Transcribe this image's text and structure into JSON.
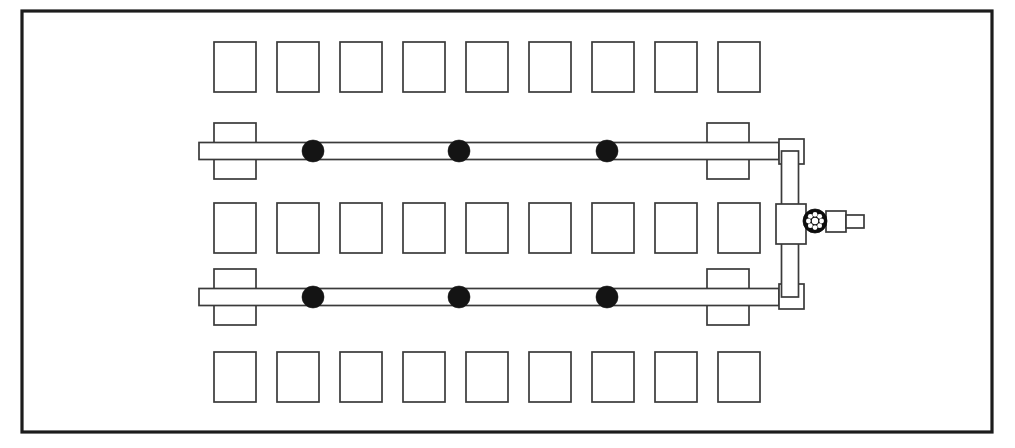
{
  "diagram": {
    "type": "technical-line-drawing",
    "width": 1015,
    "height": 448,
    "background_color": "#ffffff",
    "line_color": "#3a3a3a",
    "frame_color": "#1c1c1c",
    "fill_color": "#141414"
  },
  "frame": {
    "label": "outer-enclosure",
    "x": 22,
    "y": 11,
    "width": 970,
    "height": 421,
    "stroke_width": 3.2
  },
  "block_rows": [
    {
      "label": "upper-block-row",
      "y": 42,
      "count": 9,
      "block_width": 42,
      "block_height": 50,
      "start_x": 214,
      "pitch": 63
    },
    {
      "label": "middle-block-row",
      "y": 203,
      "count": 9,
      "block_width": 42,
      "block_height": 50,
      "start_x": 214,
      "pitch": 63
    },
    {
      "label": "lower-block-row",
      "y": 352,
      "count": 9,
      "block_width": 42,
      "block_height": 50,
      "start_x": 214,
      "pitch": 63
    }
  ],
  "pipe_rails": [
    {
      "label": "upper-spray-rail",
      "centerline_y": 151,
      "x_start": 199,
      "x_end": 779,
      "thickness": 17,
      "support_blocks": [
        {
          "x": 214,
          "width": 42,
          "height": 56
        },
        {
          "x": 707,
          "width": 42,
          "height": 56
        }
      ],
      "nozzles": [
        {
          "x": 313,
          "radius": 11
        },
        {
          "x": 459,
          "radius": 11
        },
        {
          "x": 607,
          "radius": 11
        }
      ]
    },
    {
      "label": "lower-spray-rail",
      "centerline_y": 297,
      "x_start": 199,
      "x_end": 779,
      "thickness": 17,
      "support_blocks": [
        {
          "x": 214,
          "width": 42,
          "height": 56
        },
        {
          "x": 707,
          "width": 42,
          "height": 56
        }
      ],
      "nozzles": [
        {
          "x": 313,
          "radius": 11
        },
        {
          "x": 459,
          "radius": 11
        },
        {
          "x": 607,
          "radius": 11
        }
      ]
    }
  ],
  "riser": {
    "label": "vertical-riser-pipe",
    "centerline_x": 790,
    "y_top": 151,
    "y_bottom": 297,
    "thickness": 17,
    "elbows": [
      {
        "label": "top-elbow",
        "x": 779,
        "y": 139,
        "size": 25
      },
      {
        "label": "bottom-elbow",
        "x": 779,
        "y": 284,
        "size": 25
      }
    ]
  },
  "valve": {
    "label": "handwheel-gate-valve",
    "tee": {
      "x": 776,
      "y": 204,
      "width": 30,
      "height": 40
    },
    "wheel": {
      "center_x": 815,
      "center_y": 221,
      "outer_radius": 12,
      "hub_radius": 3.2,
      "spoke_count": 8,
      "color": "#0d0d0d"
    },
    "outlet_stub": {
      "x": 826,
      "y": 211,
      "width": 20,
      "height": 21
    },
    "outlet_nozzle": {
      "x": 846,
      "y": 215,
      "width": 18,
      "height": 13
    }
  },
  "legend": {
    "block_name": "nozzle-block",
    "rail_name": "spray-rail",
    "nozzle_name": "spray-nozzle",
    "valve_name": "gate-valve",
    "riser_name": "riser"
  }
}
